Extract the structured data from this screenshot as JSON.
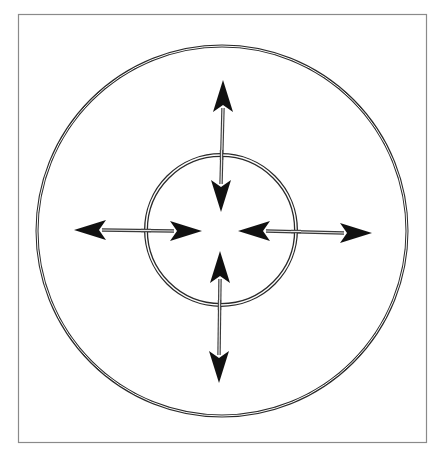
{
  "diagram": {
    "title_fragment": "",
    "frame": {
      "x": 18,
      "y": 14,
      "width": 408,
      "height": 428,
      "stroke": "#8a8a8a"
    },
    "colors": {
      "ring_stroke": "#2a2a2a",
      "ring_gap": "#ffffff",
      "shaft_stroke": "#3a3a3a",
      "arrowhead_fill": "#111111",
      "background": "#ffffff"
    },
    "outer_circle": {
      "cx": 222,
      "cy": 231,
      "r": 185,
      "style": "double-line"
    },
    "inner_circle": {
      "cx": 221,
      "cy": 230,
      "r": 75,
      "style": "double-line"
    },
    "arrows": [
      {
        "name": "vertical-top-arrow",
        "axis": "vertical",
        "outer_tip": [
          223,
          80
        ],
        "inner_tip": [
          221,
          212
        ],
        "direction": "both"
      },
      {
        "name": "vertical-bottom-arrow",
        "axis": "vertical",
        "outer_tip": [
          219,
          383
        ],
        "inner_tip": [
          220,
          251
        ],
        "direction": "both"
      },
      {
        "name": "horizontal-left-arrow",
        "axis": "horizontal",
        "outer_tip": [
          74,
          230
        ],
        "inner_tip": [
          202,
          231
        ],
        "direction": "both"
      },
      {
        "name": "horizontal-right-arrow",
        "axis": "horizontal",
        "outer_tip": [
          372,
          233
        ],
        "inner_tip": [
          238,
          231
        ],
        "direction": "both"
      }
    ]
  }
}
